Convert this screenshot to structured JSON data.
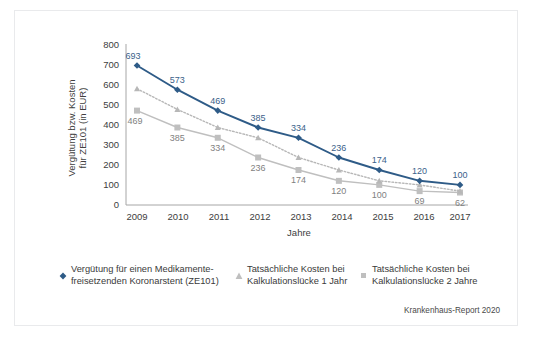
{
  "figure": {
    "credit": "Krankenhaus-Report 2020"
  },
  "chart_data": {
    "type": "line",
    "title": "",
    "xlabel": "Jahre",
    "ylabel": "Vergütung bzw. Kosten für ZE101 (in EUR)",
    "ylabel_line1": "Vergütung bzw. Kosten",
    "ylabel_line2": "für ZE101 (in EUR)",
    "categories": [
      "2009",
      "2010",
      "2011",
      "2012",
      "2013",
      "2014",
      "2015",
      "2016",
      "2017"
    ],
    "ylim": [
      0,
      800
    ],
    "yticks": [
      0,
      100,
      200,
      300,
      400,
      500,
      600,
      700,
      800
    ],
    "grid": false,
    "legend_position": "bottom",
    "series": [
      {
        "name": "Vergütung für einen Medikamente-freisetzenden Koronarstent (ZE101)",
        "name_line1": "Vergütung für einen Medikamente-",
        "name_line2": "freisetzenden Koronarstent (ZE101)",
        "marker": "diamond",
        "linestyle": "solid",
        "color": "#2e5b87",
        "values": [
          693,
          573,
          469,
          385,
          334,
          236,
          174,
          120,
          100
        ],
        "labels": [
          "693",
          "573",
          "469",
          "385",
          "334",
          "236",
          "174",
          "120",
          "100"
        ],
        "label_position": "above"
      },
      {
        "name": "Tatsächliche Kosten bei Kalkulationslücke 1 Jahr",
        "name_line1": "Tatsächliche Kosten bei",
        "name_line2": "Kalkulationslücke 1 Jahr",
        "marker": "triangle",
        "linestyle": "dotted",
        "color": "#b7b7b7",
        "values": [
          578,
          475,
          385,
          334,
          236,
          174,
          120,
          100,
          69
        ],
        "labels": [
          "",
          "",
          "",
          "",
          "",
          "",
          "",
          "",
          ""
        ],
        "label_position": "below"
      },
      {
        "name": "Tatsächliche Kosten bei Kalkulationslücke 2 Jahre",
        "name_line1": "Tatsächliche Kosten bei",
        "name_line2": "Kalkulationslücke 2 Jahre",
        "marker": "square",
        "linestyle": "solid",
        "color": "#bfbfbf",
        "values": [
          469,
          385,
          334,
          236,
          174,
          120,
          100,
          69,
          62
        ],
        "labels": [
          "469",
          "385",
          "334",
          "236",
          "174",
          "120",
          "100",
          "69",
          "62"
        ],
        "label_position": "below"
      }
    ]
  },
  "axis": {
    "y_ticks": [
      "800",
      "700",
      "600",
      "500",
      "400",
      "300",
      "200",
      "100",
      "0"
    ],
    "x_ticks": [
      "2009",
      "2010",
      "2011",
      "2012",
      "2013",
      "2014",
      "2015",
      "2016",
      "2017"
    ]
  },
  "legend": {
    "items": [
      {
        "marker": "diamond",
        "color": "#2e5b87",
        "line1": "Vergütung für einen Medikamente-",
        "line2": "freisetzenden Koronarstent (ZE101)"
      },
      {
        "marker": "triangle",
        "color": "#bfbfbf",
        "line1": "Tatsächliche Kosten bei",
        "line2": "Kalkulationslücke 1 Jahr"
      },
      {
        "marker": "square",
        "color": "#bfbfbf",
        "line1": "Tatsächliche Kosten bei",
        "line2": "Kalkulationslücke 2 Jahre"
      }
    ]
  }
}
